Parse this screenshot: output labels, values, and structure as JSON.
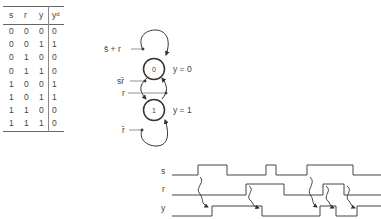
{
  "truth_table": {
    "headers": [
      "s",
      "r",
      "y",
      "y",
      "d"
    ],
    "header_labels": {
      "s": "s",
      "r": "r",
      "y": "y",
      "yd_base": "y",
      "yd_sup": "d"
    },
    "rows": [
      [
        "0",
        "0",
        "0",
        "0"
      ],
      [
        "0",
        "0",
        "1",
        "1"
      ],
      [
        "0",
        "1",
        "0",
        "0"
      ],
      [
        "0",
        "1",
        "1",
        "0"
      ],
      [
        "1",
        "0",
        "0",
        "1"
      ],
      [
        "1",
        "0",
        "1",
        "1"
      ],
      [
        "1",
        "1",
        "0",
        "0"
      ],
      [
        "1",
        "1",
        "1",
        "0"
      ]
    ]
  },
  "state_diagram": {
    "states": [
      {
        "id": "0",
        "label": "0",
        "output": "y = 0"
      },
      {
        "id": "1",
        "label": "1",
        "output": "y = 1"
      }
    ],
    "transitions": {
      "self_loop_0": "s̄ + r",
      "zero_to_one": "sr̄",
      "one_to_zero": "r",
      "self_loop_1": "r̄"
    }
  },
  "timing_diagram": {
    "signals": [
      {
        "name": "s"
      },
      {
        "name": "r"
      },
      {
        "name": "y"
      }
    ]
  }
}
